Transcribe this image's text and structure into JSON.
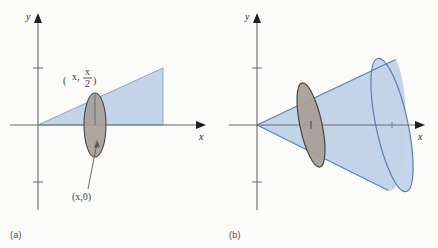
{
  "figure": {
    "width": 438,
    "height": 248,
    "background_color": "#fbfbfa"
  },
  "panels": [
    {
      "id": "a",
      "caption": "(a)",
      "axes": {
        "x_label": "x",
        "y_label": "y",
        "origin": {
          "x": 38,
          "y": 125
        },
        "x_axis_end": 205,
        "y_axis_top": 16,
        "y_axis_bottom": 210,
        "ticks_y": [
          68,
          182
        ],
        "axis_color": "#6b6b6b"
      },
      "region": {
        "name": "triangle",
        "fill_color": "#c3d3e8",
        "stroke_color": "#8aa6c8",
        "vertices": "38,125 163,68 163,125",
        "description": "right triangle under line y = x/2 from origin to x"
      },
      "cross_section": {
        "name": "disk-edge-view",
        "fill_color": "#a6a098",
        "stroke_color": "#4a4540",
        "center": {
          "x": 95,
          "y": 125
        },
        "rx": 11,
        "ry": 32
      },
      "labels": [
        {
          "name": "top-point-label",
          "text_parts": {
            "open": "(",
            "x": "x",
            "comma": ", ",
            "num": "x",
            "den": "2",
            "close": ")"
          },
          "plain": "(x, x/2)",
          "position": {
            "x": 66,
            "y": 78
          }
        },
        {
          "name": "bottom-point-label",
          "plain": "(x,0)",
          "position": {
            "x": 72,
            "y": 197
          }
        }
      ],
      "leader_line": {
        "from": {
          "x": 88,
          "y": 189
        },
        "to": {
          "x": 97,
          "y": 143
        }
      }
    },
    {
      "id": "b",
      "caption": "(b)",
      "axes": {
        "x_label": "x",
        "y_label": "y",
        "origin": {
          "x": 38,
          "y": 125
        },
        "x_axis_end": 205,
        "y_axis_top": 16,
        "y_axis_bottom": 210,
        "ticks_y": [
          68,
          182
        ],
        "axis_color": "#6b6b6b"
      },
      "region": {
        "name": "cone",
        "fill_color": "#c3d3e8",
        "stroke_color": "#5b7fb0",
        "apex": {
          "x": 38,
          "y": 125
        },
        "base_center": {
          "x": 173,
          "y": 125
        },
        "base_rx": 16,
        "base_ry": 68,
        "base_tilt_deg": -12,
        "description": "solid cone of revolution about the x-axis"
      },
      "cross_section": {
        "name": "disk-face-view",
        "fill_color": "#a6a098",
        "stroke_color": "#4a4540",
        "center": {
          "x": 92,
          "y": 125
        },
        "rx": 11,
        "ry": 43,
        "tilt_deg": -12
      },
      "axis_markers": [
        {
          "name": "disk-center-marker",
          "x": 92,
          "y": 125
        },
        {
          "name": "base-center-marker",
          "x": 173,
          "y": 125
        }
      ]
    }
  ]
}
